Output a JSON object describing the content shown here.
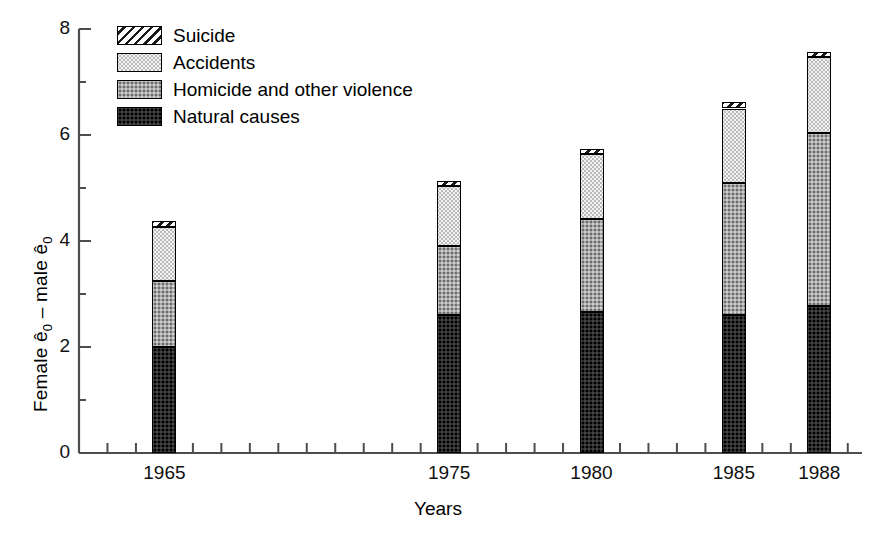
{
  "chart_data": {
    "type": "bar",
    "stacked": true,
    "title": "",
    "xlabel": "Years",
    "ylabel": "Female ê0 – male ê0",
    "ylabel_parts": {
      "lead": "Female ê",
      "sub1": "0",
      "mid": " – male ê",
      "sub2": "0"
    },
    "categories": [
      "1965",
      "1975",
      "1980",
      "1985",
      "1988"
    ],
    "x_positions": [
      1965,
      1975,
      1980,
      1985,
      1988
    ],
    "xlim": [
      1962,
      1989.5
    ],
    "ylim": [
      0,
      8
    ],
    "yticks": [
      0,
      2,
      4,
      6,
      8
    ],
    "ytick_labels": [
      "0",
      "2",
      "4",
      "6",
      "8"
    ],
    "yminor_ticks": [
      1,
      3,
      5,
      7
    ],
    "xtick_step": 1,
    "grid": false,
    "legend_position": "upper-left-inside",
    "series": [
      {
        "name": "Natural causes",
        "pattern": "dark-solid",
        "color": "#2b2b2b",
        "values": [
          2.0,
          2.6,
          2.66,
          2.6,
          2.78
        ]
      },
      {
        "name": "Homicide and other violence",
        "pattern": "medium-gray-dotted",
        "color": "#a6a6a6",
        "values": [
          1.25,
          1.3,
          1.76,
          2.5,
          3.26
        ]
      },
      {
        "name": "Accidents",
        "pattern": "light-dotted",
        "color": "#f2f2f2",
        "values": [
          1.02,
          1.13,
          1.22,
          1.4,
          1.43
        ]
      },
      {
        "name": "Suicide",
        "pattern": "diagonal-hatch",
        "color": "#ffffff",
        "values": [
          0.1,
          0.1,
          0.1,
          0.12,
          0.09
        ]
      }
    ],
    "stack_totals": [
      4.37,
      5.13,
      5.74,
      6.62,
      7.56
    ]
  },
  "legend": {
    "items": [
      {
        "label": "Suicide",
        "swatch": "sw-suicide"
      },
      {
        "label": "Accidents",
        "swatch": "sw-accidents"
      },
      {
        "label": "Homicide and other violence",
        "swatch": "sw-homicide"
      },
      {
        "label": "Natural causes",
        "swatch": "sw-natural"
      }
    ]
  },
  "axes": {
    "y_tick_labels": [
      "8",
      "6",
      "4",
      "2",
      "0"
    ],
    "x_tick_labels": [
      "1965",
      "1975",
      "1980",
      "1985",
      "1988"
    ]
  }
}
